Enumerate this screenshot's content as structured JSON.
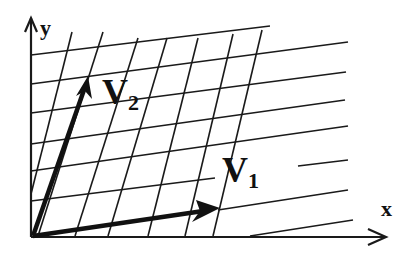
{
  "diagram": {
    "type": "vector-basis-grid",
    "axes": {
      "x_label": "x",
      "y_label": "y"
    },
    "vectors": [
      {
        "name": "V1",
        "base": "V",
        "subscript": "1",
        "from": [
          33,
          236
        ],
        "to": [
          218,
          208
        ]
      },
      {
        "name": "V2",
        "base": "V",
        "subscript": "2",
        "from": [
          33,
          236
        ],
        "to": [
          88,
          77
        ]
      }
    ],
    "colors": {
      "ink": "#1a1a1a",
      "background": "#ffffff"
    }
  }
}
